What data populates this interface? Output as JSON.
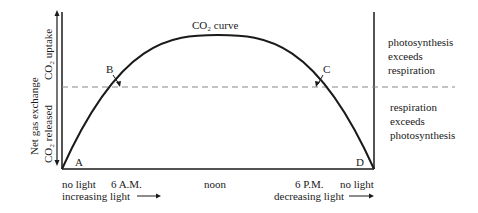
{
  "diagram": {
    "title": "CO₂ curve",
    "y_axis": {
      "label": "Net gas exchange",
      "upper": "CO₂ uptake",
      "lower": "CO₂ released"
    },
    "points": {
      "A": "A",
      "B": "B",
      "C": "C",
      "D": "D"
    },
    "x_labels": {
      "start": "no light",
      "am6": "6 A.M.",
      "noon": "noon",
      "pm6": "6 P.M.",
      "end": "no light"
    },
    "light_labels": {
      "increasing": "increasing light",
      "decreasing": "decreasing light"
    },
    "regions": {
      "above": [
        "photosynthesis",
        "exceeds",
        "respiration"
      ],
      "below": [
        "respiration",
        "exceeds",
        "photosynthesis"
      ]
    },
    "colors": {
      "line": "#1a1a1a",
      "dashed": "#888888"
    }
  }
}
